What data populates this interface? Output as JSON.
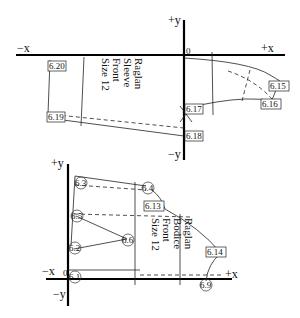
{
  "top_diagram": {
    "title_lines": [
      "Raglan",
      "Sleeve",
      "Front",
      "Size 12"
    ],
    "axes": {
      "pos_y": "+y",
      "neg_y": "−y",
      "pos_x": "+x",
      "neg_x": "−x",
      "origin": "0"
    },
    "points": [
      {
        "id": "6.20",
        "x": 34,
        "y": 65
      },
      {
        "id": "6.19",
        "x": 32,
        "y": 117
      },
      {
        "id": "6.15",
        "x": 280,
        "y": 86
      },
      {
        "id": "6.16",
        "x": 273,
        "y": 105
      },
      {
        "id": "6.17",
        "x": 170,
        "y": 108
      },
      {
        "id": "6.18",
        "x": 170,
        "y": 136
      }
    ]
  },
  "bottom_diagram": {
    "title_lines": [
      "Raglan",
      "Bodice",
      "Front",
      "Size 12"
    ],
    "axes": {
      "pos_y": "+y",
      "neg_y": "−y",
      "pos_x": "+x",
      "neg_x": "−x",
      "origin": "0"
    },
    "points": [
      {
        "id": "6.3",
        "x": 80,
        "y": 183,
        "shape": "circle"
      },
      {
        "id": "6.4",
        "x": 147,
        "y": 188,
        "shape": "circle"
      },
      {
        "id": "6.13",
        "x": 150,
        "y": 206,
        "shape": "box"
      },
      {
        "id": "6.5",
        "x": 77,
        "y": 215,
        "shape": "circle"
      },
      {
        "id": "6.6",
        "x": 128,
        "y": 241,
        "shape": "circle"
      },
      {
        "id": "6.2",
        "x": 75,
        "y": 248,
        "shape": "circle"
      },
      {
        "id": "6.1",
        "x": 75,
        "y": 276,
        "shape": "circle"
      },
      {
        "id": "6.14",
        "x": 215,
        "y": 252,
        "shape": "box"
      },
      {
        "id": "6.9",
        "x": 205,
        "y": 284,
        "shape": "circle"
      }
    ]
  }
}
